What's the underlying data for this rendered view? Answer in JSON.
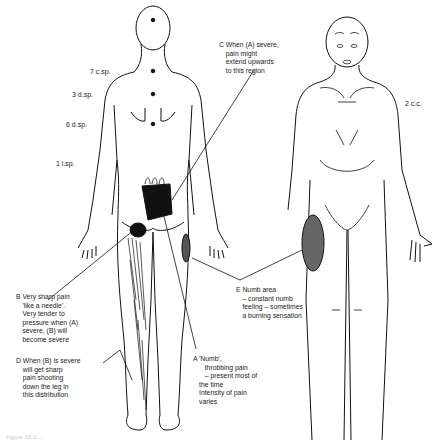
{
  "figure": {
    "caption": "Figure 15.1 ..."
  },
  "spinal_levels": [
    {
      "id": "7csp",
      "label": "7 c.sp."
    },
    {
      "id": "3dsp",
      "label": "3 d.sp."
    },
    {
      "id": "6dsp",
      "label": "6 d.sp."
    },
    {
      "id": "1lsp",
      "label": "1 l.sp."
    },
    {
      "id": "2cc",
      "label": "2 c.c."
    }
  ],
  "annotations": {
    "A": {
      "letter": "A",
      "text": "'Numb',\n   throbbing pain\n   – present most of\nthe time\nIntensity of pain\nvaries"
    },
    "B": {
      "letter": "B",
      "text": "Very sharp pain\n'like a needle'.\nVery tender to\npressure when (A)\nsevere, (B) will\nbecome severe"
    },
    "C": {
      "letter": "C",
      "text": "When (A) severe,\npain might\nextend upwards\nto this region"
    },
    "D": {
      "letter": "D",
      "text": "When (B) is severe\nwill get sharp\npain shooting\ndown the leg in\nthis distribution"
    },
    "E": {
      "letter": "E",
      "text": "Numb area\n– constant numb\nfeeling – sometimes\na burning sensation"
    }
  }
}
